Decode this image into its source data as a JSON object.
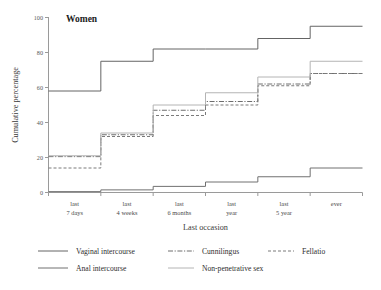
{
  "chart_data": {
    "type": "line",
    "title": "Women",
    "xlabel": "Last occasion",
    "ylabel": "Cumulative percentage",
    "categories": [
      "last 7 days",
      "last 4 weeks",
      "last 6 months",
      "last year",
      "last 5 year",
      "ever"
    ],
    "category_lines": [
      [
        "last",
        "7 days"
      ],
      [
        "last",
        "4 weeks"
      ],
      [
        "last",
        "6 months"
      ],
      [
        "last",
        "year"
      ],
      [
        "last",
        "5 year"
      ],
      [
        "ever",
        ""
      ]
    ],
    "yticks": [
      0,
      20,
      40,
      60,
      80,
      100
    ],
    "ylim": [
      0,
      100
    ],
    "grid": false,
    "step": "post",
    "legend_position": "below",
    "series": [
      {
        "name": "Vaginal intercourse",
        "style": "solid",
        "color": "#646464",
        "width": 1.0,
        "values": [
          58,
          75,
          82,
          82,
          88,
          95
        ]
      },
      {
        "name": "Cunnilingus",
        "style": "dashdot",
        "color": "#6e6e6e",
        "width": 1.0,
        "values": [
          20.5,
          33,
          47,
          52,
          62,
          68
        ]
      },
      {
        "name": "Fellatio",
        "style": "dashed",
        "color": "#7a7a7a",
        "width": 1.0,
        "values": [
          14,
          32,
          44,
          50,
          61,
          68
        ]
      },
      {
        "name": "Anal intercourse",
        "style": "solid",
        "color": "#707070",
        "width": 1.0,
        "values": [
          0.5,
          1.5,
          3.5,
          6,
          9,
          14
        ]
      },
      {
        "name": "Non-penetrative sex",
        "style": "solid-light",
        "color": "#b4b4b4",
        "width": 1.0,
        "values": [
          21,
          34,
          50,
          57,
          66,
          75
        ]
      }
    ]
  },
  "legend": {
    "items": [
      {
        "label": "Vaginal intercourse",
        "style": "solid",
        "color": "#646464"
      },
      {
        "label": "Cunnilingus",
        "style": "dashdot",
        "color": "#6e6e6e"
      },
      {
        "label": "Fellatio",
        "style": "dashed",
        "color": "#7a7a7a"
      },
      {
        "label": "Anal intercourse",
        "style": "solid",
        "color": "#707070"
      },
      {
        "label": "Non-penetrative sex",
        "style": "solid-light",
        "color": "#b4b4b4"
      }
    ]
  }
}
